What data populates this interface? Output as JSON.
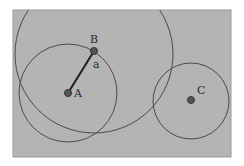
{
  "diagram": {
    "background": "#ffffff",
    "panel": {
      "x": 13,
      "y": 10,
      "width": 218,
      "height": 147,
      "fill": "#b4b4b4",
      "stroke": "#9a9a9a"
    },
    "stroke_color": "#4a4a4a",
    "point_color": "#555555",
    "points": [
      {
        "id": "A",
        "label": "A",
        "x": 68,
        "y": 93,
        "label_x": 74,
        "label_y": 97
      },
      {
        "id": "B",
        "label": "B",
        "x": 94,
        "y": 51,
        "label_x": 90,
        "label_y": 43
      },
      {
        "id": "C",
        "label": "C",
        "x": 191,
        "y": 100,
        "label_x": 197,
        "label_y": 94
      }
    ],
    "segments": [
      {
        "id": "a",
        "from": "A",
        "to": "B",
        "label": "a",
        "label_x": 93,
        "label_y": 68
      }
    ],
    "circles": [
      {
        "id": "circle-B",
        "center": "B",
        "cx": 94,
        "cy": 54,
        "r": 79
      },
      {
        "id": "circle-A",
        "center": "A",
        "cx": 68,
        "cy": 93,
        "r": 49
      },
      {
        "id": "circle-C",
        "center": "C",
        "cx": 191,
        "cy": 101,
        "r": 38
      }
    ]
  }
}
